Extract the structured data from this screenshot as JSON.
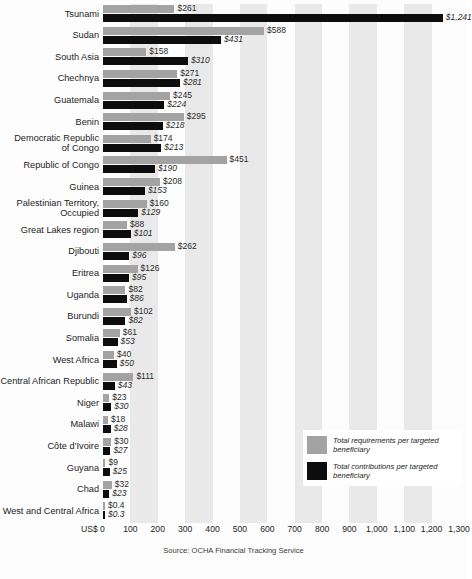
{
  "chart_data": {
    "type": "bar",
    "orientation": "horizontal",
    "title": "",
    "subtitle": "",
    "xlabel": "US$",
    "ylabel": "",
    "xlim": [
      0,
      1300
    ],
    "grid": "vertical alternating shaded bands every 100 units",
    "legend_position": "inside-right-lower",
    "source": "Source: OCHA Financial Tracking Service",
    "axis_unit_label": "US$ 0",
    "tick_labels": [
      "100",
      "200",
      "300",
      "400",
      "500",
      "600",
      "700",
      "800",
      "900",
      "1,000",
      "1,100",
      "1,200",
      "1,300"
    ],
    "tick_values": [
      100,
      200,
      300,
      400,
      500,
      600,
      700,
      800,
      900,
      1000,
      1100,
      1200,
      1300
    ],
    "categories": [
      "Tsunami",
      "Sudan",
      "South Asia",
      "Chechnya",
      "Guatemala",
      "Benin",
      "Democratic Republic\nof Congo",
      "Republic of Congo",
      "Guinea",
      "Palestinian Territory,\nOccupied",
      "Great Lakes region",
      "Djibouti",
      "Eritrea",
      "Uganda",
      "Burundi",
      "Somalia",
      "West Africa",
      "Central African Republic",
      "Niger",
      "Malawi",
      "Côte d’Ivoire",
      "Guyana",
      "Chad",
      "West and Central Africa"
    ],
    "series": [
      {
        "name": "Total requirements per targeted beneficiary",
        "color": "#a3a3a3",
        "values": [
          261,
          588,
          158,
          271,
          245,
          295,
          174,
          451,
          208,
          160,
          88,
          262,
          126,
          82,
          102,
          61,
          40,
          111,
          23,
          18,
          30,
          9,
          32,
          0.4
        ],
        "labels": [
          "$261",
          "$588",
          "$158",
          "$271",
          "$245",
          "$295",
          "$174",
          "$451",
          "$208",
          "$160",
          "$88",
          "$262",
          "$126",
          "$82",
          "$102",
          "$61",
          "$40",
          "$111",
          "$23",
          "$18",
          "$30",
          "$9",
          "$32",
          "$0.4"
        ]
      },
      {
        "name": "Total contributions per targeted beneficiary",
        "color": "#0d0d0d",
        "values": [
          1241,
          431,
          310,
          281,
          224,
          218,
          213,
          190,
          153,
          129,
          101,
          96,
          95,
          86,
          82,
          53,
          50,
          43,
          30,
          28,
          27,
          25,
          23,
          0.3
        ],
        "labels": [
          "$1,241",
          "$431",
          "$310",
          "$281",
          "$224",
          "$218",
          "$213",
          "$190",
          "$153",
          "$129",
          "$101",
          "$96",
          "$95",
          "$86",
          "$82",
          "$53",
          "$50",
          "$43",
          "$30",
          "$28",
          "$27",
          "$25",
          "$23",
          "$0.3"
        ]
      }
    ]
  },
  "legend": {
    "items": [
      {
        "label": "Total requirements per targeted beneficiary",
        "color": "#a3a3a3"
      },
      {
        "label": "Total contributions per targeted beneficiary",
        "color": "#0d0d0d"
      }
    ]
  },
  "footer": {
    "source": "Source: OCHA Financial Tracking Service"
  }
}
